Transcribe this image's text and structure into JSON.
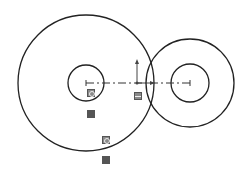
{
  "sketch": {
    "colors": {
      "geometry": "#222222",
      "centerline": "#333333",
      "relation_icon": "#8a8a8a"
    },
    "large_gear": {
      "center": [
        86,
        83
      ],
      "outer_radius": 68,
      "inner_radius": 18
    },
    "small_gear": {
      "center": [
        190,
        83
      ],
      "outer_radius": 44,
      "inner_radius": 19
    },
    "origin": {
      "position": [
        137,
        83
      ]
    },
    "relation_icons": [
      {
        "name": "concentric-relation-icon",
        "position": [
          87,
          89
        ]
      },
      {
        "name": "tangent-relation-icon",
        "position": [
          87,
          110
        ]
      },
      {
        "name": "horizontal-relation-icon",
        "position": [
          134,
          92
        ]
      },
      {
        "name": "concentric-relation-icon",
        "position": [
          102,
          136
        ]
      },
      {
        "name": "tangent-relation-icon",
        "position": [
          102,
          156
        ]
      }
    ]
  }
}
